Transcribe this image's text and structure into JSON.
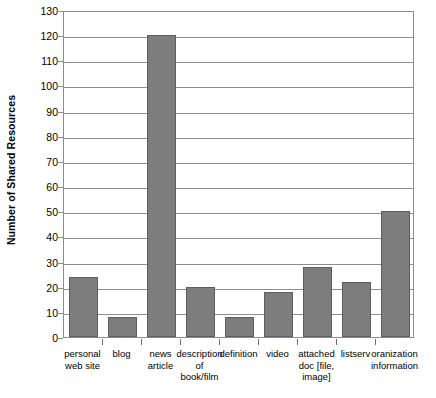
{
  "chart_data": {
    "type": "bar",
    "title": "",
    "xlabel": "",
    "ylabel": "Number of Shared Resources",
    "ylim": [
      0,
      130
    ],
    "ytick_step": 10,
    "grid": true,
    "legend": "none",
    "bar_color": "#7d7d7d",
    "axis_color": "#8d8d8d",
    "categories": [
      "personal\nweb site",
      "blog",
      "news\narticle",
      "description\nof\nbook/film",
      "definition",
      "video",
      "attached\ndoc [file,\nimage]",
      "listserv",
      "oranization\ninformation"
    ],
    "values": [
      24,
      8,
      120,
      20,
      8,
      18,
      28,
      22,
      50
    ],
    "ytick_labels": [
      "0",
      "10",
      "20",
      "30",
      "40",
      "50",
      "60",
      "70",
      "80",
      "90",
      "100",
      "110",
      "120",
      "130"
    ]
  }
}
